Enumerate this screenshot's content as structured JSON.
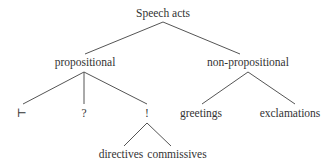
{
  "diagram": {
    "type": "tree",
    "nodes": {
      "root": {
        "label": "Speech acts",
        "x": 163,
        "y": 17
      },
      "propositional": {
        "label": "propositional",
        "x": 85,
        "y": 66
      },
      "non_propositional": {
        "label": "non-propositional",
        "x": 248,
        "y": 66
      },
      "assertion": {
        "label": "⊢",
        "x": 22,
        "y": 117
      },
      "question": {
        "label": "?",
        "x": 84,
        "y": 117
      },
      "exclamation_mark": {
        "label": "!",
        "x": 147,
        "y": 117
      },
      "greetings": {
        "label": "greetings",
        "x": 201,
        "y": 117
      },
      "exclamations": {
        "label": "exclamations",
        "x": 290,
        "y": 117
      },
      "directives": {
        "label": "directives",
        "x": 121,
        "y": 158
      },
      "commissives": {
        "label": "commissives",
        "x": 177,
        "y": 158
      }
    },
    "edges": [
      {
        "from": "root",
        "to": "propositional",
        "x1": 163,
        "y1": 22,
        "x2": 85,
        "y2": 54
      },
      {
        "from": "root",
        "to": "non_propositional",
        "x1": 163,
        "y1": 22,
        "x2": 240,
        "y2": 54
      },
      {
        "from": "propositional",
        "to": "assertion",
        "x1": 84,
        "y1": 72,
        "x2": 23,
        "y2": 104
      },
      {
        "from": "propositional",
        "to": "question",
        "x1": 84,
        "y1": 72,
        "x2": 84,
        "y2": 104
      },
      {
        "from": "propositional",
        "to": "exclamation_mark",
        "x1": 84,
        "y1": 72,
        "x2": 147,
        "y2": 104
      },
      {
        "from": "non_propositional",
        "to": "greetings",
        "x1": 248,
        "y1": 72,
        "x2": 202,
        "y2": 104
      },
      {
        "from": "non_propositional",
        "to": "exclamations",
        "x1": 248,
        "y1": 72,
        "x2": 295,
        "y2": 104
      },
      {
        "from": "exclamation_mark",
        "to": "directives",
        "x1": 147,
        "y1": 123,
        "x2": 124,
        "y2": 146
      },
      {
        "from": "exclamation_mark",
        "to": "commissives",
        "x1": 147,
        "y1": 123,
        "x2": 171,
        "y2": 146
      }
    ]
  }
}
